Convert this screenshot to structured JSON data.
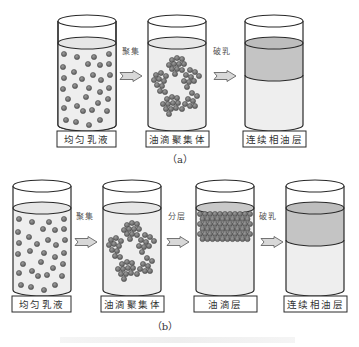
{
  "figure": {
    "panel_a": {
      "sublabel": "（a）",
      "beakers": [
        {
          "state": "uniform-emulsion",
          "label": "均匀乳液"
        },
        {
          "state": "droplet-aggregates",
          "label": "油滴聚集体"
        },
        {
          "state": "continuous-oil-layer",
          "label": "连续相油层"
        }
      ],
      "steps": [
        "聚集",
        "破乳"
      ]
    },
    "panel_b": {
      "sublabel": "（b）",
      "beakers": [
        {
          "state": "uniform-emulsion",
          "label": "均匀乳液"
        },
        {
          "state": "droplet-aggregates",
          "label": "油滴聚集体"
        },
        {
          "state": "droplet-layer",
          "label": "油滴层"
        },
        {
          "state": "continuous-oil-layer",
          "label": "连续相油层"
        }
      ],
      "steps": [
        "聚集",
        "分层",
        "破乳"
      ]
    },
    "colors": {
      "liquid": "#eeeeee",
      "oil_layer": "#c4c4c4",
      "droplet": "#7a7a7a",
      "outline": "#2a2a2a",
      "arrow_fill": "#d8d8d8"
    }
  }
}
